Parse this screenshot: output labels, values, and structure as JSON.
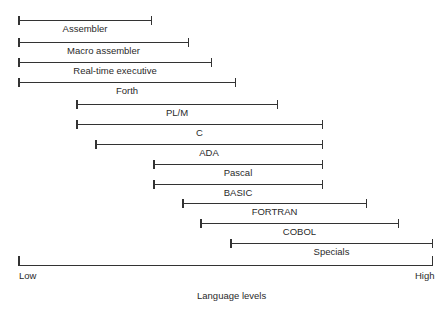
{
  "diagram": {
    "title": "Language levels",
    "axis": {
      "low_label": "Low",
      "high_label": "High"
    },
    "languages": [
      {
        "name": "Assembler",
        "start": 19,
        "end": 151,
        "y": 20
      },
      {
        "name": "Macro assembler",
        "start": 19,
        "end": 188,
        "y": 42
      },
      {
        "name": "Real-time executive",
        "start": 19,
        "end": 211,
        "y": 62
      },
      {
        "name": "Forth",
        "start": 19,
        "end": 235,
        "y": 82
      },
      {
        "name": "PL/M",
        "start": 77,
        "end": 277,
        "y": 104
      },
      {
        "name": "C",
        "start": 77,
        "end": 322,
        "y": 124
      },
      {
        "name": "ADA",
        "start": 96,
        "end": 322,
        "y": 144
      },
      {
        "name": "Pascal",
        "start": 154,
        "end": 322,
        "y": 164
      },
      {
        "name": "BASIC",
        "start": 154,
        "end": 322,
        "y": 184
      },
      {
        "name": "FORTRAN",
        "start": 183,
        "end": 366,
        "y": 203
      },
      {
        "name": "COBOL",
        "start": 201,
        "end": 398,
        "y": 223
      },
      {
        "name": "Specials",
        "start": 231,
        "end": 432,
        "y": 243
      }
    ]
  }
}
